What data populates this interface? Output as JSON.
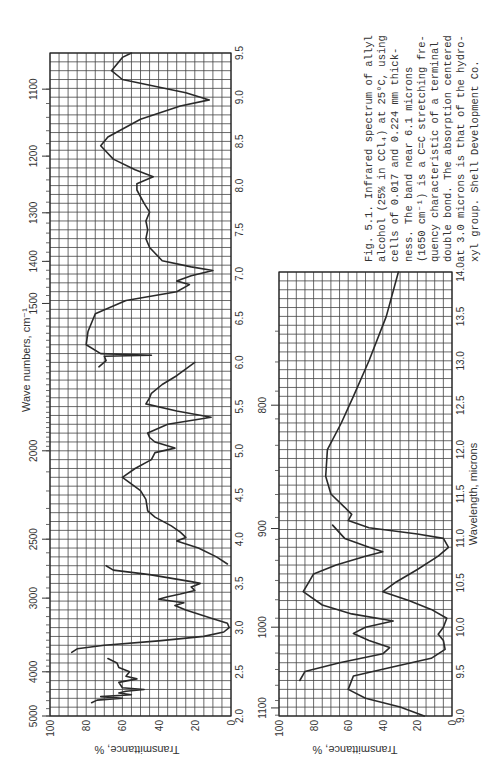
{
  "caption": {
    "lines": [
      "Fig. 5.1. Infrared spectrum of allyl",
      "alcohol (25% in CCl₄) at 25°C, using",
      "cells of 0.017 and 0.224 mm thick-",
      "ness.  The band near 6.1 microns",
      "(1650 cm⁻¹) is a C=C stretching fre-",
      "quency characteristic of a terminal",
      "double bond.  The absorption centered",
      "at 3.0 microns is that of the hydro-",
      "xyl group.  Shell Development Co."
    ]
  },
  "chart_data": [
    {
      "type": "line",
      "title": "Infrared spectrum of allyl alcohol, 2.0–9.5 microns",
      "xlabel": "Wave numbers, cm⁻¹",
      "ylabel": "Transmittance, %",
      "x_bottom_label": "",
      "wavelength_range": [
        2.0,
        9.5
      ],
      "transmittance_range": [
        0,
        100
      ],
      "wavelength_ticks": [
        "2.0",
        "2.5",
        "3.0",
        "3.5",
        "4.0",
        "4.5",
        "5.0",
        "5.5",
        "6.0",
        "6.5",
        "7.0",
        "7.5",
        "8.0",
        "8.5",
        "9.0",
        "9.5"
      ],
      "wavenumber_ticks": [
        "5000",
        "4000",
        "3000",
        "2500",
        "2000",
        "1500",
        "1400",
        "1300",
        "1200",
        "1100"
      ],
      "transmittance_ticks": [
        "100",
        "80",
        "60",
        "40",
        "20",
        "0"
      ],
      "grid": true,
      "series": [
        {
          "name": "thin cell (short segment)",
          "points": [
            [
              2.15,
              77
            ],
            [
              2.18,
              74
            ],
            [
              2.2,
              60
            ],
            [
              2.22,
              72
            ],
            [
              2.24,
              55
            ],
            [
              2.26,
              62
            ],
            [
              2.28,
              58
            ],
            [
              2.3,
              48
            ],
            [
              2.32,
              60
            ],
            [
              2.38,
              62
            ],
            [
              2.42,
              52
            ],
            [
              2.45,
              58
            ],
            [
              2.5,
              56
            ],
            [
              2.55,
              62
            ],
            [
              2.6,
              63
            ],
            [
              2.65,
              68
            ]
          ]
        },
        {
          "name": "main spectrum",
          "points": [
            [
              2.72,
              88
            ],
            [
              2.76,
              85
            ],
            [
              2.8,
              70
            ],
            [
              2.85,
              40
            ],
            [
              2.9,
              15
            ],
            [
              2.95,
              4
            ],
            [
              3.0,
              1
            ],
            [
              3.05,
              2
            ],
            [
              3.1,
              10
            ],
            [
              3.2,
              25
            ],
            [
              3.25,
              31
            ],
            [
              3.28,
              26
            ],
            [
              3.32,
              40
            ],
            [
              3.35,
              35
            ],
            [
              3.38,
              28
            ],
            [
              3.42,
              20
            ],
            [
              3.46,
              22
            ],
            [
              3.5,
              17
            ],
            [
              3.52,
              22
            ],
            [
              3.6,
              45
            ],
            [
              3.65,
              65
            ],
            [
              3.7,
              69
            ]
          ]
        },
        {
          "name": "3.7-6.0 segment",
          "points": [
            [
              3.72,
              2
            ],
            [
              3.8,
              8
            ],
            [
              3.9,
              18
            ],
            [
              3.98,
              30
            ],
            [
              4.02,
              25
            ],
            [
              4.08,
              28
            ],
            [
              4.15,
              33
            ],
            [
              4.25,
              42
            ],
            [
              4.32,
              46
            ],
            [
              4.45,
              47
            ],
            [
              4.55,
              50
            ],
            [
              4.7,
              60
            ],
            [
              4.8,
              53
            ],
            [
              4.9,
              44
            ],
            [
              4.98,
              42
            ],
            [
              5.03,
              31
            ],
            [
              5.1,
              42
            ],
            [
              5.15,
              45
            ],
            [
              5.2,
              46
            ],
            [
              5.3,
              35
            ],
            [
              5.38,
              11
            ],
            [
              5.45,
              30
            ],
            [
              5.53,
              47
            ],
            [
              5.6,
              45
            ],
            [
              5.65,
              44
            ],
            [
              5.75,
              38
            ],
            [
              5.85,
              30
            ],
            [
              6.0,
              20
            ]
          ]
        },
        {
          "name": "1500-1100 region",
          "points": [
            [
              5.95,
              73
            ],
            [
              6.02,
              69
            ],
            [
              6.07,
              70
            ],
            [
              6.08,
              44
            ],
            [
              6.1,
              72
            ],
            [
              6.2,
              80
            ],
            [
              6.35,
              79
            ],
            [
              6.55,
              75
            ],
            [
              6.7,
              58
            ],
            [
              6.8,
              30
            ],
            [
              6.88,
              23
            ],
            [
              6.92,
              30
            ],
            [
              6.98,
              22
            ],
            [
              7.04,
              10
            ],
            [
              7.08,
              22
            ],
            [
              7.15,
              38
            ],
            [
              7.3,
              45
            ],
            [
              7.4,
              47
            ],
            [
              7.5,
              46
            ],
            [
              7.6,
              47
            ],
            [
              7.7,
              45
            ],
            [
              7.8,
              48
            ],
            [
              7.95,
              52
            ],
            [
              8.02,
              52
            ],
            [
              8.1,
              43
            ],
            [
              8.18,
              53
            ],
            [
              8.3,
              65
            ],
            [
              8.45,
              72
            ],
            [
              8.55,
              68
            ],
            [
              8.75,
              50
            ],
            [
              8.9,
              28
            ],
            [
              8.97,
              12
            ],
            [
              9.05,
              25
            ],
            [
              9.2,
              60
            ],
            [
              9.3,
              66
            ],
            [
              9.45,
              60
            ],
            [
              9.5,
              55
            ]
          ]
        }
      ]
    },
    {
      "type": "line",
      "title": "Infrared spectrum of allyl alcohol, 9.0–14.0 microns",
      "xlabel": "Wavelength, microns",
      "ylabel": "Transmittance, %",
      "wavelength_range": [
        9.0,
        14.0
      ],
      "transmittance_range": [
        0,
        100
      ],
      "wavelength_ticks": [
        "9.0",
        "9.5",
        "10.0",
        "10.5",
        "11.0",
        "11.5",
        "12.0",
        "12.5",
        "13.0",
        "13.5",
        "14.0"
      ],
      "wavenumber_ticks": [
        "1100",
        "1000",
        "900",
        "800"
      ],
      "transmittance_ticks": [
        "100",
        "80",
        "60",
        "40",
        "20",
        "0"
      ],
      "grid": true,
      "series": [
        {
          "name": "thin cell (0.017 mm)",
          "points": [
            [
              9.4,
              88
            ],
            [
              9.5,
              85
            ],
            [
              9.6,
              65
            ],
            [
              9.7,
              40
            ],
            [
              9.77,
              36
            ],
            [
              9.85,
              48
            ],
            [
              9.93,
              57
            ],
            [
              10.0,
              50
            ],
            [
              10.07,
              34
            ],
            [
              10.15,
              58
            ],
            [
              10.25,
              75
            ],
            [
              10.4,
              86
            ],
            [
              10.5,
              83
            ],
            [
              10.6,
              80
            ],
            [
              10.7,
              67
            ],
            [
              10.8,
              50
            ],
            [
              10.85,
              40
            ],
            [
              10.9,
              48
            ],
            [
              11.0,
              62
            ],
            [
              11.15,
              69
            ]
          ]
        },
        {
          "name": "thick cell (0.224 mm)",
          "points": [
            [
              9.0,
              16
            ],
            [
              9.1,
              30
            ],
            [
              9.2,
              50
            ],
            [
              9.3,
              60
            ],
            [
              9.45,
              57
            ],
            [
              9.55,
              35
            ],
            [
              9.65,
              12
            ],
            [
              9.75,
              4
            ],
            [
              9.85,
              5
            ],
            [
              9.92,
              8
            ],
            [
              10.0,
              5
            ],
            [
              10.1,
              3
            ],
            [
              10.2,
              12
            ],
            [
              10.3,
              25
            ],
            [
              10.4,
              40
            ],
            [
              10.5,
              33
            ],
            [
              10.65,
              20
            ],
            [
              10.8,
              8
            ],
            [
              10.9,
              2
            ],
            [
              11.0,
              5
            ],
            [
              11.05,
              20
            ],
            [
              11.12,
              48
            ],
            [
              11.2,
              60
            ],
            [
              11.27,
              58
            ],
            [
              11.35,
              62
            ],
            [
              11.5,
              70
            ],
            [
              11.7,
              73
            ],
            [
              12.0,
              72
            ],
            [
              12.3,
              64
            ],
            [
              12.6,
              57
            ],
            [
              13.0,
              48
            ],
            [
              13.5,
              38
            ],
            [
              14.0,
              31
            ]
          ]
        }
      ]
    }
  ],
  "chart1": {
    "ylabel": "Transmittance, %",
    "xlabel": "Wave numbers, cm⁻¹"
  },
  "chart2": {
    "ylabel": "Transmittance, %",
    "xlabel": "Wavelength, microns"
  }
}
